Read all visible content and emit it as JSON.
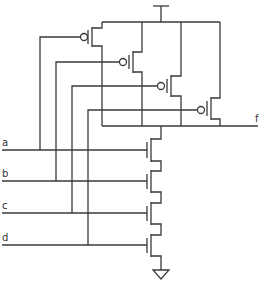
{
  "diagram": {
    "type": "CMOS 4-input NAND gate schematic",
    "inputs": [
      {
        "label": "a",
        "y": 150
      },
      {
        "label": "b",
        "y": 181
      },
      {
        "label": "c",
        "y": 213
      },
      {
        "label": "d",
        "y": 245
      }
    ],
    "output": {
      "label": "f"
    },
    "supply": {
      "name": "VDD",
      "symbol": "T-bar"
    },
    "ground": {
      "name": "GND",
      "symbol": "triangle"
    },
    "pmos_parallel": [
      {
        "gate": "a"
      },
      {
        "gate": "b"
      },
      {
        "gate": "c"
      },
      {
        "gate": "d"
      }
    ],
    "nmos_series": [
      {
        "gate": "a"
      },
      {
        "gate": "b"
      },
      {
        "gate": "c"
      },
      {
        "gate": "d"
      }
    ],
    "colors": {
      "wire": "#3a3a3a",
      "background": "#ffffff",
      "text": "#333333"
    }
  }
}
